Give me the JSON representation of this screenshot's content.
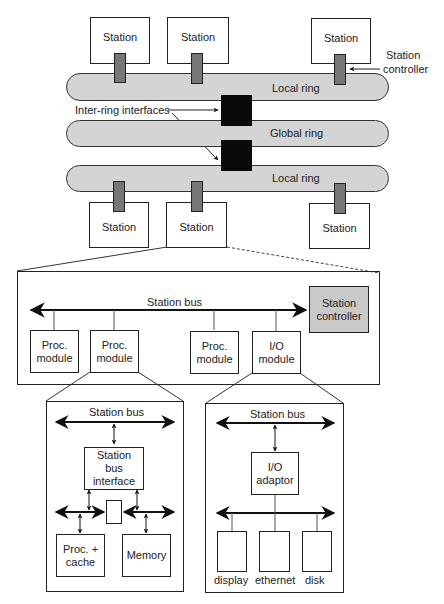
{
  "top_system": {
    "stations_top": [
      "Station",
      "Station",
      "Station"
    ],
    "stations_bottom": [
      "Station",
      "Station",
      "Station"
    ],
    "rings": {
      "local_top": "Local ring",
      "global": "Global ring",
      "local_bottom": "Local ring"
    },
    "annotations": {
      "inter_ring": "Inter-ring interfaces",
      "station_controller_1": "Station",
      "station_controller_2": "controller"
    }
  },
  "station_detail": {
    "bus_label": "Station bus",
    "modules": [
      {
        "l1": "Proc.",
        "l2": "module"
      },
      {
        "l1": "Proc.",
        "l2": "module"
      },
      {
        "l1": "Proc.",
        "l2": "module"
      },
      {
        "l1": "I/O",
        "l2": "module"
      }
    ],
    "controller": {
      "l1": "Station",
      "l2": "controller"
    }
  },
  "proc_detail": {
    "bus_label": "Station bus",
    "interface": {
      "l1": "Station",
      "l2": "bus",
      "l3": "interface"
    },
    "proc": {
      "l1": "Proc. +",
      "l2": "cache"
    },
    "memory": "Memory"
  },
  "io_detail": {
    "bus_label": "Station bus",
    "adaptor": {
      "l1": "I/O",
      "l2": "adaptor"
    },
    "devices": [
      "display",
      "ethernet",
      "disk"
    ]
  },
  "colors": {
    "ring": "#d4d4d4",
    "controller": "#777777",
    "interface": "#0a0a0a",
    "station_controller_box": "#c9c9c9"
  }
}
